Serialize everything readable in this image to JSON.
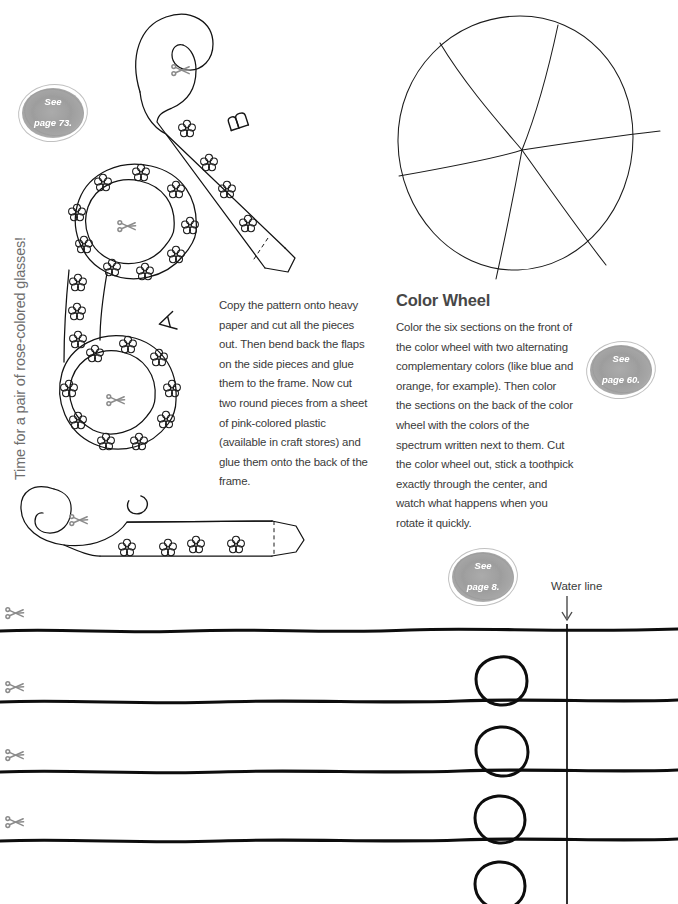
{
  "page": {
    "side_title": "Time for a pair of rose-colored glasses!",
    "background_color": "#ffffff",
    "ink_color": "#121212",
    "text_color": "#3a3a3a"
  },
  "badges": [
    {
      "id": "badge-73",
      "line1": "See",
      "line2": "page 73."
    },
    {
      "id": "badge-60",
      "line1": "See",
      "line2": "page 60."
    },
    {
      "id": "badge-8",
      "line1": "See",
      "line2": "page 8."
    }
  ],
  "glasses_project": {
    "instructions": "Copy the pattern onto heavy paper and cut all the pieces out. Then bend back the flaps on the side pieces and glue them to the frame. Now cut two round pieces from a sheet of pink-colored plastic (available in craft stores) and glue them onto the back of the frame.",
    "piece_labels": [
      "A",
      "B",
      "C"
    ],
    "cut_icon": "scissors-icon",
    "decoration": "flower-cluster"
  },
  "color_wheel_project": {
    "heading": "Color Wheel",
    "instructions": "Color the six sections on the front of the color wheel with two alternating complementary colors (like blue and orange, for example). Then color the sections on the back of the color wheel with the colors of the spectrum written next to them. Cut the color wheel out, stick a toothpick exactly through the center, and watch what happens when you rotate it quickly.",
    "sections": 6
  },
  "water_experiment": {
    "label": "Water line",
    "arrow_icon": "arrow-down-icon",
    "wave_count": 4,
    "bubble_count": 4,
    "cut_icon": "scissors-icon",
    "scissors_count": 4
  }
}
